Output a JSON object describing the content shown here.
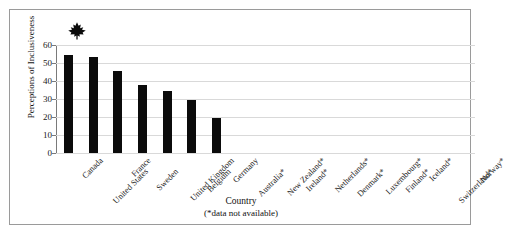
{
  "figure": {
    "top_clipped_text": "······",
    "frame_color": "#9a9a9a",
    "background": "#ffffff"
  },
  "marker": {
    "name": "maple-leaf-icon",
    "country": "Canada",
    "color": "#0b0b0b"
  },
  "chart_data": {
    "type": "bar",
    "title": "",
    "xlabel": "Country",
    "xlabel_note": "(*data not available)",
    "ylabel": "Perceptions of Inclusiveness",
    "ylim": [
      0,
      60
    ],
    "ytick_step": 10,
    "yticks": [
      "60",
      "50",
      "40",
      "30",
      "20",
      "10",
      "0"
    ],
    "grid": true,
    "legend": false,
    "bar_color": "#0b0b0b",
    "categories": [
      "Canada",
      "United States",
      "France",
      "Sweden",
      "United Kingdom",
      "Belgium",
      "Germany",
      "Australia*",
      "New Zealand*",
      "Ireland*",
      "Netherlands*",
      "Denmark*",
      "Luxembourg*",
      "Finland*",
      "Iceland*",
      "Switzerland*",
      "Norway*"
    ],
    "values": [
      54.5,
      53.5,
      45.5,
      38,
      34.5,
      29.5,
      19.5,
      null,
      null,
      null,
      null,
      null,
      null,
      null,
      null,
      null,
      null
    ]
  }
}
